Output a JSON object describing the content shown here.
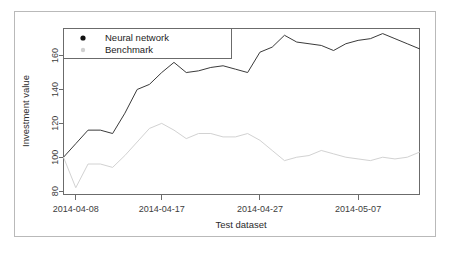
{
  "chart_data": {
    "type": "line",
    "title": "",
    "xlabel": "Test dataset",
    "ylabel": "Investment value",
    "grid": false,
    "legend_position": "top-left",
    "xlim": [
      0,
      29
    ],
    "ylim": [
      78,
      176
    ],
    "ytick_values": [
      80,
      100,
      120,
      140,
      160
    ],
    "ytick_labels": [
      "80",
      "100",
      "120",
      "140",
      "160"
    ],
    "xtick_positions": [
      1,
      8,
      16,
      24
    ],
    "xtick_labels": [
      "2014-04-08",
      "2014-04-17",
      "2014-04-27",
      "2014-05-07"
    ],
    "x": [
      0,
      1,
      2,
      3,
      4,
      5,
      6,
      7,
      8,
      9,
      10,
      11,
      12,
      13,
      14,
      15,
      16,
      17,
      18,
      19,
      20,
      21,
      22,
      23,
      24,
      25,
      26,
      27,
      28,
      29
    ],
    "series": [
      {
        "name": "Neural network",
        "color": "#3a3a3a",
        "marker": "dot",
        "values": [
          100,
          108,
          116,
          116,
          114,
          126,
          140,
          143,
          150,
          156,
          150,
          151,
          153,
          154,
          152,
          150,
          162,
          165,
          172,
          168,
          167,
          166,
          163,
          167,
          169,
          170,
          173,
          170,
          167,
          164
        ]
      },
      {
        "name": "Benchmark",
        "color": "#d2d2d2",
        "marker": "dot",
        "values": [
          100,
          82,
          96,
          96,
          94,
          101,
          109,
          117,
          120,
          116,
          111,
          114,
          114,
          112,
          112,
          114,
          110,
          104,
          98,
          100,
          101,
          104,
          102,
          100,
          99,
          98,
          100,
          99,
          100,
          103
        ]
      }
    ]
  },
  "legend": {
    "items": [
      {
        "label": "Neural network",
        "marker_color": "#111111"
      },
      {
        "label": "Benchmark",
        "marker_color": "#d0d0d0"
      }
    ]
  }
}
